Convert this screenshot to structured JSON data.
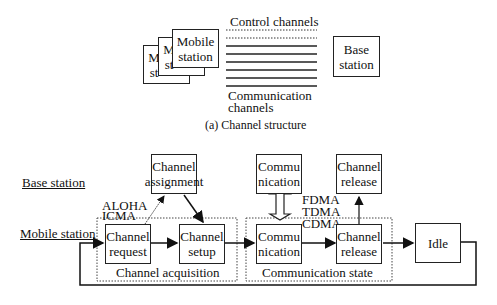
{
  "part_a": {
    "mobile_stack": [
      "M st",
      "M st"
    ],
    "mobile_station": "Mobile station",
    "base_station": "Base station",
    "control_channels": "Control channels",
    "communication_channels_line1": "Communication",
    "communication_channels_line2": "channels",
    "caption": "(a) Channel structure"
  },
  "part_b": {
    "row_base_station": "Base station",
    "row_mobile_station": "Mobile station",
    "aloha": "ALOHA",
    "icma": "ICMA",
    "fdma": "FDMA",
    "tdma": "TDMA",
    "cdma": "CDMA",
    "boxes": {
      "channel_assignment": [
        "Channel",
        "assignment"
      ],
      "communication_top": [
        "Commu",
        "nication"
      ],
      "channel_release_top": [
        "Channel",
        "release"
      ],
      "channel_request": [
        "Channel",
        "request"
      ],
      "channel_setup": [
        "Channel",
        "setup"
      ],
      "communication": [
        "Commu",
        "nication"
      ],
      "channel_release": [
        "Channel",
        "release"
      ],
      "idle": "Idle"
    },
    "group_channel_acquisition": "Channel acquisition",
    "group_communication_state": "Communication state"
  }
}
